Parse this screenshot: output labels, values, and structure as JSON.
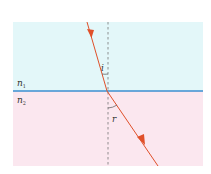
{
  "diagram": {
    "media": [
      {
        "label": "n",
        "subscript": "1",
        "color": "#e3f7f9"
      },
      {
        "label": "n",
        "subscript": "2",
        "color": "#fbe7ef"
      }
    ],
    "interface_color": "#3b8fd0",
    "ray_color": "#e0502a",
    "normal_color": "#777777",
    "angles": {
      "incidence": "i",
      "refraction": "r"
    }
  }
}
